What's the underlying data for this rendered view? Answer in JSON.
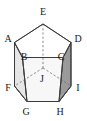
{
  "figure": {
    "kind": "pentagonal-prism-diagram",
    "title": "",
    "canvas": {
      "width": 87,
      "height": 121
    },
    "colors": {
      "stroke": "#3b3b3b",
      "hidden_stroke": "#6e6e6e",
      "label": "#1a1a1a",
      "top_face_fill": "#ffffff",
      "left_face_fill": "#e6e6e6",
      "right_face_fill": "#9a9a9a",
      "front_face_fill": "#f2f2f2",
      "bottom_face_fill": "#ebebeb",
      "background": "#ffffff"
    },
    "vertices": [
      {
        "id": "A",
        "label": "A",
        "x": 14.5,
        "y": 42.5,
        "label_x": 8,
        "label_y": 39,
        "hidden": false
      },
      {
        "id": "B",
        "label": "B",
        "x": 22.5,
        "y": 57.5,
        "label_x": 24,
        "label_y": 57,
        "hidden": false
      },
      {
        "id": "C",
        "label": "C",
        "x": 63.0,
        "y": 57.5,
        "label_x": 61,
        "label_y": 57,
        "hidden": false
      },
      {
        "id": "D",
        "label": "D",
        "x": 71.0,
        "y": 42.5,
        "label_x": 78,
        "label_y": 39,
        "hidden": false
      },
      {
        "id": "E",
        "label": "E",
        "x": 43.0,
        "y": 24.0,
        "label_x": 43,
        "label_y": 12,
        "hidden": false
      },
      {
        "id": "F",
        "label": "F",
        "x": 14.5,
        "y": 86.0,
        "label_x": 8,
        "label_y": 88,
        "hidden": false
      },
      {
        "id": "G",
        "label": "G",
        "x": 27.0,
        "y": 101.5,
        "label_x": 26,
        "label_y": 112,
        "hidden": false
      },
      {
        "id": "H",
        "label": "H",
        "x": 59.0,
        "y": 101.5,
        "label_x": 60,
        "label_y": 112,
        "hidden": false
      },
      {
        "id": "I",
        "label": "I",
        "x": 71.0,
        "y": 86.0,
        "label_x": 78,
        "label_y": 88,
        "hidden": false
      },
      {
        "id": "J",
        "label": "J",
        "x": 43.0,
        "y": 68.0,
        "label_x": 42,
        "label_y": 79,
        "hidden": true
      }
    ],
    "edges": [
      {
        "from": "A",
        "to": "E",
        "style": "solid"
      },
      {
        "from": "E",
        "to": "D",
        "style": "solid"
      },
      {
        "from": "A",
        "to": "B",
        "style": "solid"
      },
      {
        "from": "D",
        "to": "C",
        "style": "solid"
      },
      {
        "from": "B",
        "to": "C",
        "style": "solid"
      },
      {
        "from": "F",
        "to": "G",
        "style": "solid"
      },
      {
        "from": "G",
        "to": "H",
        "style": "solid"
      },
      {
        "from": "H",
        "to": "I",
        "style": "solid"
      },
      {
        "from": "A",
        "to": "F",
        "style": "solid"
      },
      {
        "from": "B",
        "to": "G",
        "style": "solid"
      },
      {
        "from": "C",
        "to": "H",
        "style": "solid"
      },
      {
        "from": "D",
        "to": "I",
        "style": "solid"
      },
      {
        "from": "E",
        "to": "J",
        "style": "dashed"
      },
      {
        "from": "J",
        "to": "F",
        "style": "dashed"
      },
      {
        "from": "J",
        "to": "I",
        "style": "dashed"
      }
    ],
    "faces": [
      {
        "name": "top-pentagon",
        "vertices": [
          "A",
          "E",
          "D",
          "C",
          "B"
        ],
        "fill": "top_face_fill"
      },
      {
        "name": "left-quad",
        "vertices": [
          "A",
          "B",
          "G",
          "F"
        ],
        "fill": "left_face_fill"
      },
      {
        "name": "right-quad",
        "vertices": [
          "D",
          "C",
          "H",
          "I"
        ],
        "fill": "right_face_fill"
      },
      {
        "name": "front-quad",
        "vertices": [
          "B",
          "C",
          "H",
          "G"
        ],
        "fill": "front_face_fill"
      },
      {
        "name": "bottom-pentagon",
        "vertices": [
          "F",
          "G",
          "H",
          "I",
          "J"
        ],
        "fill": "bottom_face_fill"
      }
    ],
    "labels": [
      "A",
      "B",
      "C",
      "D",
      "E",
      "F",
      "G",
      "H",
      "I",
      "J"
    ]
  }
}
